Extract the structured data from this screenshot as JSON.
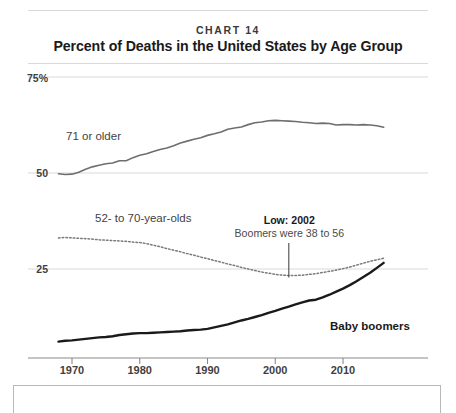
{
  "chart_data": {
    "type": "line",
    "kicker": "CHART 14",
    "title": "Percent of Deaths in the United States by Age Group",
    "xlabel": "",
    "ylabel": "",
    "xlim": [
      1967,
      2016
    ],
    "ylim": [
      0,
      75
    ],
    "grid": true,
    "legend_position": "inline-labels",
    "yticks": [
      25,
      50,
      75
    ],
    "ytick_labels": [
      "25",
      "50",
      "75%"
    ],
    "xticks": [
      1970,
      1980,
      1990,
      2000,
      2010
    ],
    "xtick_labels": [
      "1970",
      "1980",
      "1990",
      "2000",
      "2010"
    ],
    "annotations": [
      {
        "name": "low-2002",
        "title": "Low: 2002",
        "subtitle": "Boomers were 38 to 56",
        "x": 2002,
        "y": 23.3
      }
    ],
    "series": [
      {
        "name": "71 or older",
        "label": "71 or older",
        "style": "solid",
        "color": "#6e6e6e",
        "width": 1.6,
        "x": [
          1968,
          1969,
          1970,
          1971,
          1972,
          1973,
          1974,
          1975,
          1976,
          1977,
          1978,
          1979,
          1980,
          1981,
          1982,
          1983,
          1984,
          1985,
          1986,
          1987,
          1988,
          1989,
          1990,
          1991,
          1992,
          1993,
          1994,
          1995,
          1996,
          1997,
          1998,
          1999,
          2000,
          2001,
          2002,
          2003,
          2004,
          2005,
          2006,
          2007,
          2008,
          2009,
          2010,
          2011,
          2012,
          2013,
          2014,
          2015,
          2016
        ],
        "y": [
          49.8,
          49.6,
          49.7,
          50.2,
          51.0,
          51.6,
          52.0,
          52.4,
          52.6,
          53.2,
          53.2,
          54.0,
          54.6,
          55.0,
          55.6,
          56.1,
          56.5,
          57.1,
          57.8,
          58.3,
          58.8,
          59.2,
          59.8,
          60.2,
          60.7,
          61.4,
          61.7,
          62.0,
          62.6,
          63.1,
          63.3,
          63.6,
          63.7,
          63.6,
          63.5,
          63.4,
          63.2,
          63.1,
          62.9,
          63.0,
          62.9,
          62.5,
          62.6,
          62.6,
          62.5,
          62.6,
          62.5,
          62.3,
          61.9
        ]
      },
      {
        "name": "52- to 70-year-olds",
        "label": "52- to 70-year-olds",
        "style": "dotted",
        "color": "#7a7a7a",
        "width": 1.5,
        "x": [
          1968,
          1969,
          1970,
          1971,
          1972,
          1973,
          1974,
          1975,
          1976,
          1977,
          1978,
          1979,
          1980,
          1981,
          1982,
          1983,
          1984,
          1985,
          1986,
          1987,
          1988,
          1989,
          1990,
          1991,
          1992,
          1993,
          1994,
          1995,
          1996,
          1997,
          1998,
          1999,
          2000,
          2001,
          2002,
          2003,
          2004,
          2005,
          2006,
          2007,
          2008,
          2009,
          2010,
          2011,
          2012,
          2013,
          2014,
          2015,
          2016
        ],
        "y": [
          33.1,
          33.2,
          33.1,
          33.0,
          32.9,
          32.8,
          32.6,
          32.5,
          32.4,
          32.3,
          32.2,
          32.0,
          31.9,
          31.6,
          31.2,
          30.8,
          30.3,
          29.9,
          29.5,
          29.0,
          28.6,
          28.1,
          27.7,
          27.2,
          26.8,
          26.3,
          25.9,
          25.4,
          25.0,
          24.6,
          24.2,
          23.9,
          23.6,
          23.4,
          23.3,
          23.3,
          23.4,
          23.6,
          23.8,
          24.1,
          24.4,
          24.7,
          25.1,
          25.5,
          26.0,
          26.5,
          27.0,
          27.4,
          27.8
        ]
      },
      {
        "name": "Baby boomers",
        "label": "Baby boomers",
        "style": "solid",
        "color": "#1a1a1a",
        "width": 2.4,
        "x": [
          1968,
          1969,
          1970,
          1971,
          1972,
          1973,
          1974,
          1975,
          1976,
          1977,
          1978,
          1979,
          1980,
          1981,
          1982,
          1983,
          1984,
          1985,
          1986,
          1987,
          1988,
          1989,
          1990,
          1991,
          1992,
          1993,
          1994,
          1995,
          1996,
          1997,
          1998,
          1999,
          2000,
          2001,
          2002,
          2003,
          2004,
          2005,
          2006,
          2007,
          2008,
          2009,
          2010,
          2011,
          2012,
          2013,
          2014,
          2015,
          2016
        ],
        "y": [
          6.1,
          6.3,
          6.4,
          6.6,
          6.8,
          7.0,
          7.2,
          7.3,
          7.5,
          7.8,
          8.0,
          8.2,
          8.3,
          8.3,
          8.4,
          8.5,
          8.6,
          8.7,
          8.8,
          9.0,
          9.1,
          9.2,
          9.4,
          9.8,
          10.2,
          10.6,
          11.1,
          11.6,
          12.0,
          12.5,
          13.0,
          13.6,
          14.1,
          14.7,
          15.2,
          15.8,
          16.3,
          16.8,
          17.0,
          17.6,
          18.3,
          19.1,
          19.9,
          20.8,
          21.8,
          22.9,
          24.0,
          25.3,
          26.6
        ]
      }
    ]
  }
}
